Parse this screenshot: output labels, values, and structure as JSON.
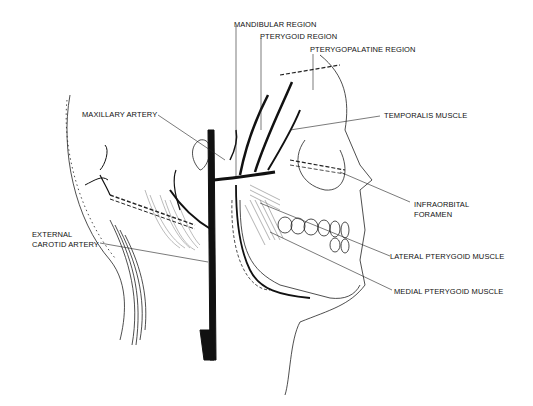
{
  "figure": {
    "labels": {
      "mandibular_region": "MANDIBULAR REGION",
      "pterygoid_region": "PTERYGOID REGION",
      "pterygopalatine_region": "PTERYGOPALATINE REGION",
      "maxillary_artery": "MAXILLARY ARTERY",
      "temporalis_muscle": "TEMPORALIS MUSCLE",
      "infraorbital_foramen_line1": "INFRAORBITAL",
      "infraorbital_foramen_line2": "FORAMEN",
      "external_carotid_line1": "EXTERNAL",
      "external_carotid_line2": "CAROTID ARTERY",
      "lateral_pterygoid": "LATERAL PTERYGOID MUSCLE",
      "medial_pterygoid": "MEDIAL PTERYGOID MUSCLE"
    },
    "colors": {
      "ink": "#111111",
      "background": "#ffffff"
    }
  }
}
